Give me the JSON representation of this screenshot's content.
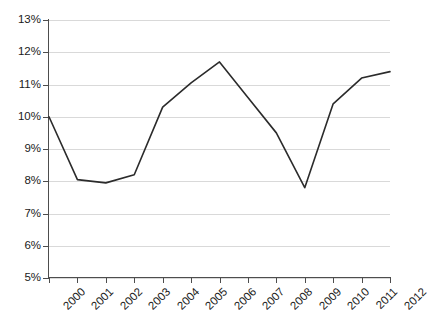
{
  "chart_data": {
    "type": "line",
    "title": "",
    "subtitle": "",
    "xlabel": "",
    "ylabel": "",
    "categories": [
      "2000",
      "2001",
      "2002",
      "2003",
      "2004",
      "2005",
      "2006",
      "2007",
      "2008",
      "2009",
      "2010",
      "2011",
      "2012"
    ],
    "values": [
      10.0,
      8.05,
      7.95,
      8.2,
      10.3,
      11.05,
      11.7,
      10.6,
      9.5,
      7.8,
      10.4,
      11.2,
      11.4
    ],
    "value_unit": "%",
    "ylim": [
      5,
      13
    ],
    "ytick_step": 1,
    "ytick_labels": [
      "13%",
      "12%",
      "11%",
      "10%",
      "9%",
      "8%",
      "7%",
      "6%",
      "5%"
    ],
    "ytick_values": [
      13,
      12,
      11,
      10,
      9,
      8,
      7,
      6,
      5
    ],
    "grid": true,
    "grid_axis": "y",
    "legend": false,
    "legend_position": "none",
    "markers": false,
    "series": [
      {
        "name": "",
        "values": [
          10.0,
          8.05,
          7.95,
          8.2,
          10.3,
          11.05,
          11.7,
          10.6,
          9.5,
          7.8,
          10.4,
          11.2,
          11.4
        ]
      }
    ]
  },
  "style": {
    "line_color": "#2b2b2b",
    "grid_color": "#d9d9d9",
    "axis_color": "#4d4d4d",
    "text_color": "#1a1a1a",
    "background": "#ffffff"
  }
}
